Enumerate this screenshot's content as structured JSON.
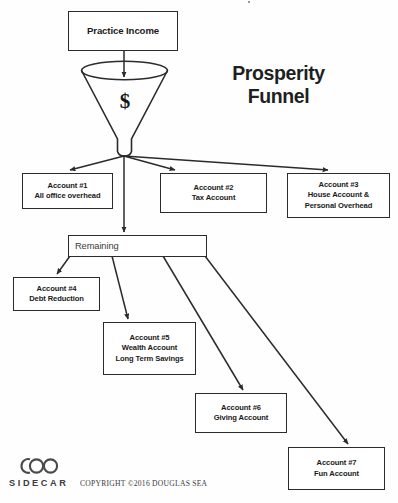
{
  "diagram": {
    "title_lines": [
      "Prosperity",
      "Funnel"
    ],
    "funnel_symbol": "$",
    "source": {
      "label": "Practice Income"
    },
    "remaining": {
      "label": "Remaining"
    },
    "nodes": [
      {
        "id": "account1",
        "lines": [
          "Account #1",
          "All office overhead"
        ]
      },
      {
        "id": "account2",
        "lines": [
          "Account #2",
          "Tax Account"
        ]
      },
      {
        "id": "account3",
        "lines": [
          "Account #3",
          "House Account &",
          "Personal Overhead"
        ]
      },
      {
        "id": "account4",
        "lines": [
          "Account #4",
          "Debt Reduction"
        ]
      },
      {
        "id": "account5",
        "lines": [
          "Account #5",
          "Wealth Account",
          "Long Term Savings"
        ]
      },
      {
        "id": "account6",
        "lines": [
          "Account #6",
          "Giving Account"
        ]
      },
      {
        "id": "account7",
        "lines": [
          "Account #7",
          "Fun Account"
        ]
      }
    ],
    "flows": [
      {
        "from": "Practice Income",
        "to": "Funnel"
      },
      {
        "from": "Funnel",
        "to": "Account #1"
      },
      {
        "from": "Funnel",
        "to": "Account #2"
      },
      {
        "from": "Funnel",
        "to": "Account #3"
      },
      {
        "from": "Funnel",
        "to": "Remaining"
      },
      {
        "from": "Remaining",
        "to": "Account #4"
      },
      {
        "from": "Remaining",
        "to": "Account #5"
      },
      {
        "from": "Remaining",
        "to": "Account #6"
      },
      {
        "from": "Remaining",
        "to": "Account #7"
      }
    ]
  },
  "footer": {
    "brand": "SIDECAR",
    "logo": "sidecar-coo-logo",
    "copyright": "COPYRIGHT ©2016 DOUGLAS SEA"
  },
  "colors": {
    "stroke": "#2b2b2b",
    "text": "#1a1a1a",
    "background": "#ffffff"
  }
}
